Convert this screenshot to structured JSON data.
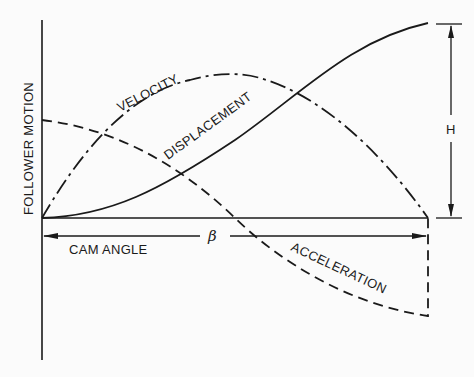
{
  "diagram": {
    "y_axis_label": "FOLLOWER MOTION",
    "x_axis_label": "CAM ANGLE",
    "angle_symbol": "β",
    "rise_symbol": "H",
    "curves": [
      {
        "name": "DISPLACEMENT",
        "style": "solid",
        "shape": "S-curve rising from 0 to H over β"
      },
      {
        "name": "VELOCITY",
        "style": "dash-dot",
        "shape": "hump, zero at ends, max at β/2"
      },
      {
        "name": "ACCELERATION",
        "style": "dashed",
        "shape": "positive max at start, crosses zero at β/2, negative max at β"
      }
    ],
    "colors": {
      "ink": "#1a1a1a",
      "background": "#fbfbfb"
    }
  }
}
